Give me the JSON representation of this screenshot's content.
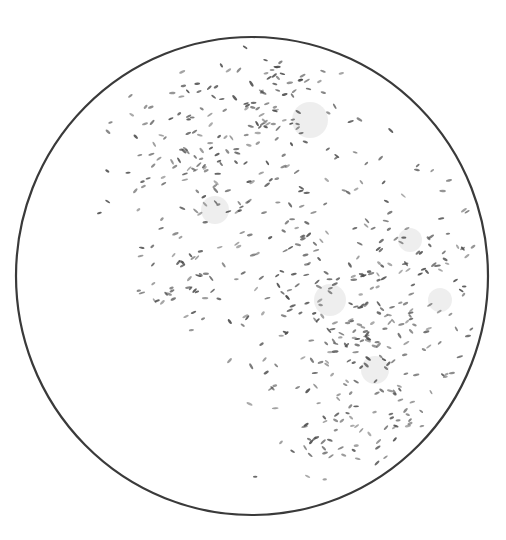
{
  "figure": {
    "field_circle": {
      "cx": 252,
      "cy": 276,
      "rx": 236,
      "ry": 239,
      "stroke": "#3a3a3a",
      "stroke_width": 2.2
    },
    "cell_color": "#4a4a4a",
    "haze_color": "#cfcfcf",
    "clusters": [
      {
        "name": "upper-left-cluster",
        "cx": 235,
        "cy": 170,
        "sx": 55,
        "sy": 60,
        "count": 190,
        "seed": 11
      },
      {
        "name": "top-spur",
        "cx": 290,
        "cy": 95,
        "sx": 30,
        "sy": 25,
        "count": 45,
        "seed": 5
      },
      {
        "name": "left-tail",
        "cx": 165,
        "cy": 275,
        "sx": 22,
        "sy": 18,
        "count": 30,
        "seed": 23
      },
      {
        "name": "right-upper-cluster",
        "cx": 410,
        "cy": 250,
        "sx": 38,
        "sy": 45,
        "count": 80,
        "seed": 31
      },
      {
        "name": "lower-right-cluster",
        "cx": 360,
        "cy": 345,
        "sx": 60,
        "sy": 42,
        "count": 170,
        "seed": 47
      },
      {
        "name": "bottom-spur",
        "cx": 370,
        "cy": 430,
        "sx": 40,
        "sy": 22,
        "count": 55,
        "seed": 59
      },
      {
        "name": "center-bridge",
        "cx": 310,
        "cy": 250,
        "sx": 22,
        "sy": 30,
        "count": 35,
        "seed": 71
      }
    ],
    "hazes": [
      {
        "cx": 310,
        "cy": 120,
        "r": 18
      },
      {
        "cx": 215,
        "cy": 210,
        "r": 14
      },
      {
        "cx": 330,
        "cy": 300,
        "r": 16
      },
      {
        "cx": 375,
        "cy": 370,
        "r": 14
      },
      {
        "cx": 410,
        "cy": 240,
        "r": 12
      },
      {
        "cx": 440,
        "cy": 300,
        "r": 12
      }
    ]
  }
}
